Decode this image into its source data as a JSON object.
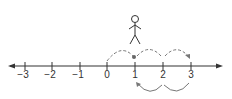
{
  "diagram": {
    "type": "number-line",
    "ticks": [
      {
        "value": -3,
        "label": "−3",
        "x": 25
      },
      {
        "value": -2,
        "label": "−2",
        "x": 52
      },
      {
        "value": -1,
        "label": "−1",
        "x": 80
      },
      {
        "value": 0,
        "label": "0",
        "x": 107
      },
      {
        "value": 1,
        "label": "1",
        "x": 135
      },
      {
        "value": 2,
        "label": "2",
        "x": 163
      },
      {
        "value": 3,
        "label": "3",
        "x": 191
      }
    ],
    "figure": {
      "description": "stick figure standing above 1",
      "position": 1
    },
    "marked_point": 1,
    "forward_jumps": [
      [
        0,
        1
      ],
      [
        1,
        2
      ],
      [
        2,
        3
      ]
    ],
    "backward_jumps": [
      [
        3,
        2
      ],
      [
        2,
        1
      ]
    ],
    "colors": {
      "line": "#333333",
      "arc": "#777777",
      "dot": "#666666"
    }
  }
}
